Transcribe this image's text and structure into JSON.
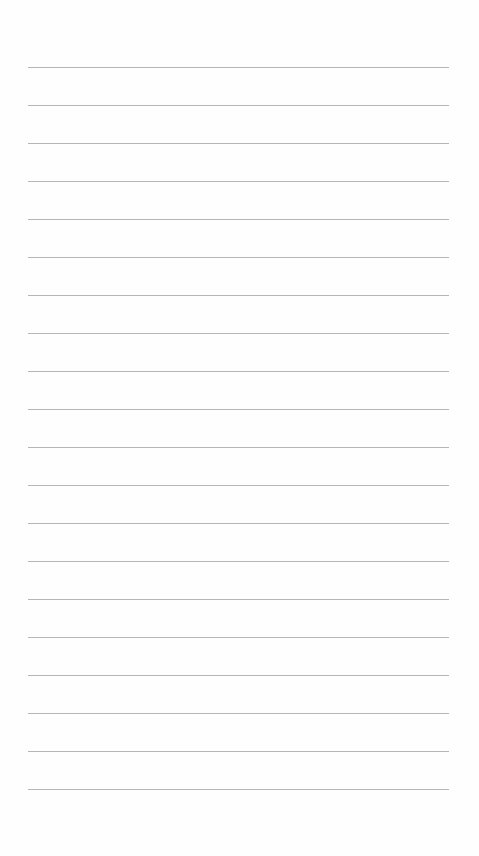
{
  "page": {
    "type": "lined-paper",
    "background_color": "#fefefe",
    "line_color": "#a9a9a9",
    "line_count": 20,
    "line_left": 28,
    "line_width": 421,
    "line_positions": [
      67,
      105,
      143,
      181,
      219,
      257,
      295,
      333,
      371,
      409,
      447,
      485,
      523,
      561,
      599,
      637,
      675,
      713,
      751,
      789
    ]
  }
}
